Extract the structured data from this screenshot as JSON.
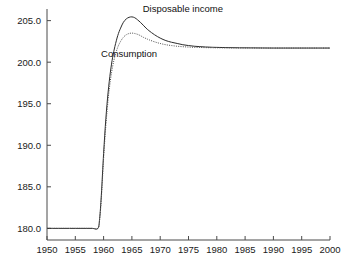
{
  "chart_data": {
    "type": "line",
    "title": "",
    "xlabel": "",
    "ylabel": "",
    "xlim": [
      1950,
      2000
    ],
    "ylim": [
      178.6,
      206.4
    ],
    "grid": false,
    "legend_position": "inline-annotation",
    "x_ticks": [
      1950,
      1955,
      1960,
      1965,
      1970,
      1975,
      1980,
      1985,
      1990,
      1995,
      2000
    ],
    "x_tick_labels": [
      "1950",
      "1955",
      "1960",
      "1965",
      "1970",
      "1975",
      "1980",
      "1985",
      "1990",
      "1995",
      "2000"
    ],
    "y_ticks": [
      180.0,
      185.0,
      190.0,
      195.0,
      200.0,
      205.0
    ],
    "y_tick_labels": [
      "180.0",
      "185.0",
      "190.0",
      "195.0",
      "200.0",
      "205.0"
    ],
    "annotations": [
      {
        "text": "Disposable income",
        "x": 1974.0,
        "y": 206.0
      },
      {
        "text": "Consumption",
        "x": 1964.5,
        "y": 200.6
      }
    ],
    "series": [
      {
        "name": "Disposable income",
        "style": "solid",
        "color": "#2b2b2b",
        "x": [
          1950,
          1951,
          1952,
          1953,
          1954,
          1955,
          1956,
          1957,
          1958,
          1959,
          1959.3,
          1959.6,
          1960,
          1960.4,
          1960.8,
          1961.2,
          1961.6,
          1962,
          1962.5,
          1963,
          1963.5,
          1964,
          1964.5,
          1965,
          1965.5,
          1966,
          1966.5,
          1967,
          1967.5,
          1968,
          1969,
          1970,
          1971,
          1972,
          1973,
          1974,
          1975,
          1976,
          1977,
          1978,
          1979,
          1980,
          1982,
          1984,
          1986,
          1988,
          1990,
          1992,
          1994,
          1996,
          1998,
          2000
        ],
        "y": [
          180.0,
          180.0,
          180.0,
          180.0,
          180.0,
          180.0,
          180.0,
          180.0,
          180.0,
          180.0,
          181.2,
          184.0,
          189.0,
          193.2,
          196.4,
          198.8,
          200.6,
          201.9,
          203.2,
          204.1,
          204.8,
          205.2,
          205.4,
          205.45,
          205.35,
          205.1,
          204.8,
          204.45,
          204.1,
          203.8,
          203.3,
          202.9,
          202.6,
          202.4,
          202.25,
          202.1,
          202.0,
          201.92,
          201.87,
          201.83,
          201.8,
          201.78,
          201.75,
          201.73,
          201.72,
          201.71,
          201.7,
          201.7,
          201.7,
          201.7,
          201.7,
          201.7
        ]
      },
      {
        "name": "Consumption",
        "style": "dotted",
        "color": "#4a4a4a",
        "x": [
          1950,
          1951,
          1952,
          1953,
          1954,
          1955,
          1956,
          1957,
          1958,
          1959,
          1959.3,
          1959.6,
          1960,
          1960.4,
          1960.8,
          1961.2,
          1961.6,
          1962,
          1962.5,
          1963,
          1963.5,
          1964,
          1964.5,
          1965,
          1965.5,
          1966,
          1966.5,
          1967,
          1967.5,
          1968,
          1969,
          1970,
          1971,
          1972,
          1973,
          1974,
          1975,
          1976,
          1977,
          1978,
          1979,
          1980,
          1982,
          1984,
          1986,
          1988,
          1990,
          1992,
          1994,
          1996,
          1998,
          2000
        ],
        "y": [
          180.0,
          180.0,
          180.0,
          180.0,
          180.0,
          180.0,
          180.0,
          180.0,
          180.0,
          180.0,
          181.0,
          183.6,
          188.4,
          192.4,
          195.5,
          197.8,
          199.5,
          200.7,
          201.8,
          202.5,
          203.0,
          203.3,
          203.45,
          203.5,
          203.45,
          203.35,
          203.2,
          203.0,
          202.85,
          202.7,
          202.45,
          202.25,
          202.1,
          202.0,
          201.92,
          201.86,
          201.82,
          201.79,
          201.77,
          201.75,
          201.74,
          201.73,
          201.72,
          201.71,
          201.71,
          201.7,
          201.7,
          201.7,
          201.7,
          201.7,
          201.7,
          201.7
        ]
      }
    ]
  }
}
